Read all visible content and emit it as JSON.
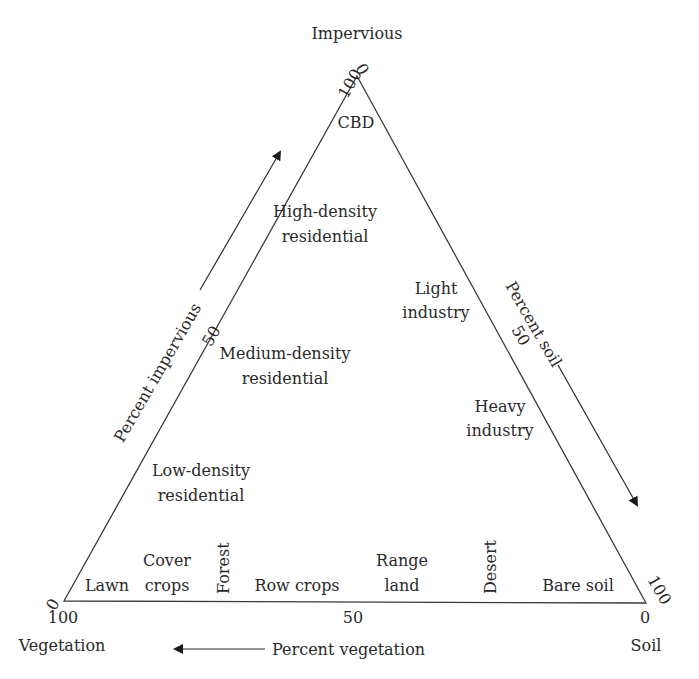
{
  "diagram": {
    "type": "ternary",
    "vertices": {
      "top": {
        "label": "Impervious",
        "x": 357,
        "y": 76
      },
      "bottom_left": {
        "label": "Vegetation",
        "x": 64,
        "y": 601
      },
      "bottom_right": {
        "label": "Soil",
        "x": 646,
        "y": 603
      }
    },
    "colors": {
      "line": "#3a3a3a",
      "text": "#2a2a2a",
      "background": "#ffffff"
    },
    "axes": {
      "impervious": {
        "label": "Percent impervious",
        "tick_top": "100",
        "tick_mid": "50",
        "tick_bottom": "0"
      },
      "soil": {
        "label": "Percent soil",
        "tick_top": "0",
        "tick_mid": "50",
        "tick_bottom": "100"
      },
      "vegetation": {
        "label": "Percent vegetation",
        "tick_left": "100",
        "tick_mid": "50",
        "tick_right": "0"
      }
    },
    "regions": {
      "cbd": "CBD",
      "high_density_1": "High-density",
      "high_density_2": "residential",
      "light_industry_1": "Light",
      "light_industry_2": "industry",
      "medium_density_1": "Medium-density",
      "medium_density_2": "residential",
      "heavy_industry_1": "Heavy",
      "heavy_industry_2": "industry",
      "low_density_1": "Low-density",
      "low_density_2": "residential",
      "lawn": "Lawn",
      "cover_crops_1": "Cover",
      "cover_crops_2": "crops",
      "forest": "Forest",
      "row_crops": "Row crops",
      "range_land_1": "Range",
      "range_land_2": "land",
      "desert": "Desert",
      "bare_soil": "Bare soil"
    }
  }
}
